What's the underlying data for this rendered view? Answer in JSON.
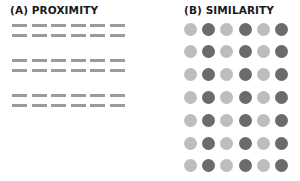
{
  "panel_a": {
    "title": "(A) PROXIMITY",
    "dash_color": "#9b9b9b",
    "groups": 3,
    "rows_per_group": 2,
    "dashes_per_row": 6,
    "row_y": [
      24,
      34,
      59,
      69,
      94,
      104
    ],
    "x_start": 12,
    "x_step": 19.5
  },
  "panel_b": {
    "title": "(B) SIMILARITY",
    "rows": 7,
    "columns": 6,
    "column_colors": [
      "light",
      "dark",
      "light",
      "dark",
      "light",
      "dark"
    ],
    "colors": {
      "light": "#bdbdbd",
      "dark": "#6b6b6b"
    },
    "x_start": 184,
    "x_step": 18.2,
    "y_start": 22.5,
    "y_step": 22.8
  }
}
